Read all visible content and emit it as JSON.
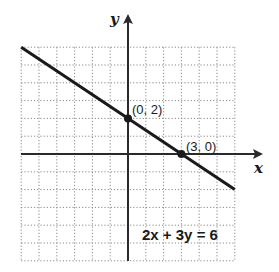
{
  "chart_data": {
    "type": "line",
    "title": "",
    "xlabel": "x",
    "ylabel": "y",
    "xlim": [
      -6,
      6
    ],
    "ylim": [
      -6,
      6
    ],
    "grid": true,
    "grid_style": "dotted",
    "grid_step": 1,
    "series": [
      {
        "name": "2x + 3y = 6",
        "equation": "2x + 3y = 6",
        "x": [
          -6,
          6
        ],
        "y": [
          6,
          -2
        ]
      }
    ],
    "points": [
      {
        "x": 0,
        "y": 2,
        "label": "(0, 2)"
      },
      {
        "x": 3,
        "y": 0,
        "label": "(3, 0)"
      }
    ],
    "annotations": [
      {
        "text": "2x + 3y = 6",
        "position": "lower-right"
      }
    ]
  },
  "labels": {
    "x_axis": "x",
    "y_axis": "y",
    "point_a": "(0, 2)",
    "point_b": "(3, 0)",
    "equation": "2x + 3y = 6"
  },
  "colors": {
    "line": "#1a1a1a",
    "grid": "#8a8a8a",
    "axis": "#2a2a2a",
    "background": "#ffffff"
  }
}
